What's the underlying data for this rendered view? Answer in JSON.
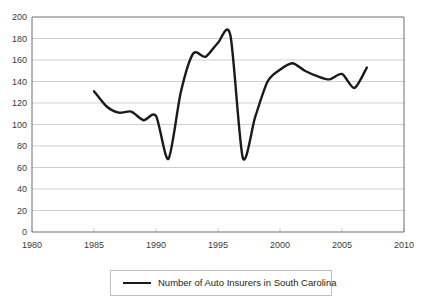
{
  "chart_data": {
    "type": "line",
    "title": "",
    "subtitle": "",
    "xlabel": "",
    "ylabel": "",
    "xlim": [
      1980,
      2010
    ],
    "ylim": [
      0,
      200
    ],
    "grid": true,
    "grid_axis": "y",
    "legend_position": "bottom-center",
    "series": [
      {
        "name": "Number of Auto Insurers in South Carolina",
        "color": "#1a1a1a",
        "x": [
          1985,
          1986,
          1987,
          1988,
          1989,
          1990,
          1991,
          1992,
          1993,
          1994,
          1995,
          1996,
          1997,
          1998,
          1999,
          2000,
          2001,
          2002,
          2003,
          2004,
          2005,
          2006,
          2007
        ],
        "values": [
          131,
          117,
          111,
          112,
          104,
          108,
          68,
          130,
          166,
          163,
          176,
          183,
          69,
          107,
          140,
          151,
          157,
          150,
          145,
          142,
          147,
          134,
          153
        ]
      }
    ],
    "x_ticks": [
      1980,
      1985,
      1990,
      1995,
      2000,
      2005,
      2010
    ],
    "x_tick_labels": [
      "1980",
      "1985",
      "1990",
      "1995",
      "2000",
      "2005",
      "2010"
    ],
    "y_ticks": [
      0,
      20,
      40,
      60,
      80,
      100,
      120,
      140,
      160,
      180,
      200
    ],
    "y_tick_labels": [
      "0",
      "20",
      "40",
      "60",
      "80",
      "100",
      "120",
      "140",
      "160",
      "180",
      "200"
    ],
    "legend_entries": [
      {
        "label": "Number of Auto Insurers in South Carolina",
        "color": "#1a1a1a"
      }
    ],
    "colors": {
      "line": "#1a1a1a",
      "gridline": "#cfcfcf",
      "axis": "#6e6e6e",
      "legend_border": "#bfbfbf",
      "background": "#ffffff",
      "text": "#231f20"
    }
  }
}
